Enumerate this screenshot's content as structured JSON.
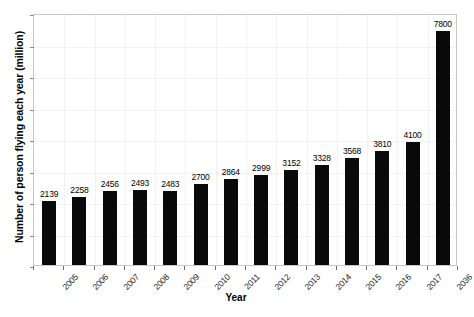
{
  "chart_data": {
    "type": "bar",
    "title": "",
    "xlabel": "Year",
    "ylabel": "Number of person flying each year (million)",
    "categories": [
      "2005",
      "2006",
      "2007",
      "2008",
      "2009",
      "2010",
      "2011",
      "2012",
      "2013",
      "2014",
      "2015",
      "2016",
      "2017",
      "2036"
    ],
    "values": [
      2139,
      2258,
      2456,
      2493,
      2483,
      2700,
      2864,
      2999,
      3152,
      3328,
      3568,
      3810,
      4100,
      7800
    ],
    "series": [
      {
        "name": "Number of person flying each year (million)",
        "values": [
          2139,
          2258,
          2456,
          2493,
          2483,
          2700,
          2864,
          2999,
          3152,
          3328,
          3568,
          3810,
          4100,
          7800
        ]
      }
    ],
    "data_labels": [
      "2139",
      "2258",
      "2456",
      "2493",
      "2483",
      "2700",
      "2864",
      "2999",
      "3152",
      "3328",
      "3568",
      "3810",
      "4100",
      "7800"
    ],
    "ylim": [
      0,
      8400
    ],
    "y_tick_labels": [],
    "grid": true,
    "legend": false,
    "legend_position": "none",
    "bar_color": "#0a0a0a",
    "background_color": "#ffffff",
    "gridline_color": "#f2f2f2",
    "axis_border_color": "#c9c9c9",
    "x_tick_label_rotation": -45
  },
  "axes": {
    "y_title": "Number of person flying each year (million)",
    "x_title": "Year"
  }
}
